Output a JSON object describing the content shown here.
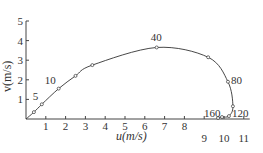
{
  "chart_data": {
    "type": "line",
    "title": "",
    "xlabel": "u(m/s)",
    "ylabel": "v(m/s)",
    "xlim": [
      0,
      11
    ],
    "ylim": [
      0,
      5
    ],
    "x_ticks": [
      "1",
      "2",
      "3",
      "4",
      "5",
      "6",
      "7",
      "8",
      "9",
      "10",
      "11"
    ],
    "y_ticks": [
      "1",
      "2",
      "3",
      "4",
      "5"
    ],
    "grid": false,
    "series": [
      {
        "name": "trajectory",
        "points": [
          {
            "u": 0,
            "v": 0
          },
          {
            "u": 0.4,
            "v": 0.35
          },
          {
            "u": 0.8,
            "v": 0.75
          },
          {
            "u": 1.65,
            "v": 1.55
          },
          {
            "u": 2.5,
            "v": 2.2
          },
          {
            "u": 3.35,
            "v": 2.75
          },
          {
            "u": 6.6,
            "v": 3.65
          },
          {
            "u": 9.2,
            "v": 3.15
          },
          {
            "u": 10.2,
            "v": 1.9
          },
          {
            "u": 10.45,
            "v": 0.65
          },
          {
            "u": 10.25,
            "v": 0.15
          },
          {
            "u": 9.9,
            "v": 0.1
          },
          {
            "u": 9.7,
            "v": 0.05
          }
        ]
      }
    ],
    "annotations": [
      {
        "text": "5",
        "u": 0.8,
        "v": 0.75
      },
      {
        "text": "10",
        "u": 1.65,
        "v": 1.55
      },
      {
        "text": "40",
        "u": 6.6,
        "v": 3.65
      },
      {
        "text": "80",
        "u": 10.2,
        "v": 1.9
      },
      {
        "text": "120",
        "u": 10.3,
        "v": 0.05
      },
      {
        "text": "160",
        "u": 9.7,
        "v": 0.05
      }
    ]
  }
}
